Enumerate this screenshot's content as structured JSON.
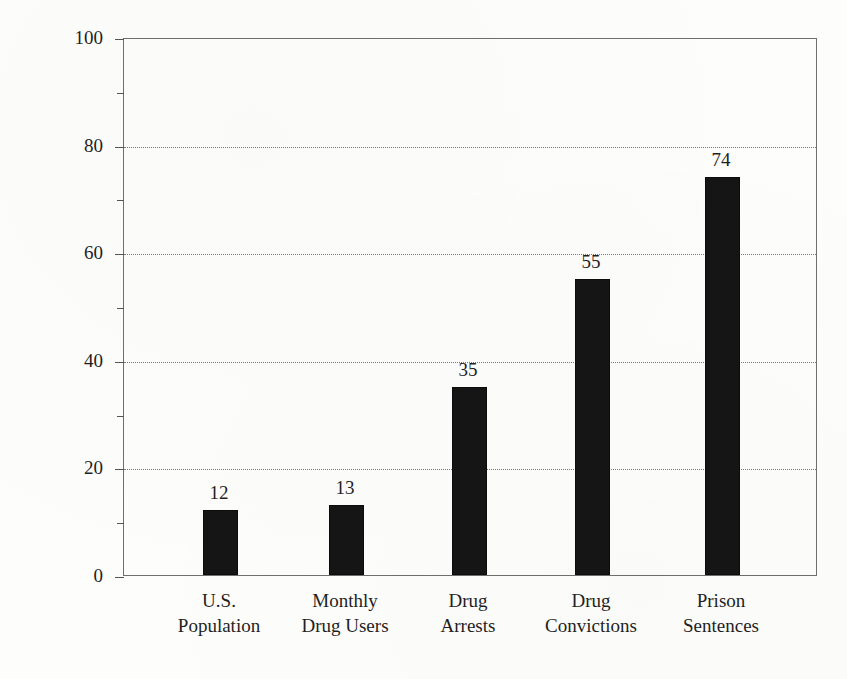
{
  "chart_data": {
    "type": "bar",
    "title": "",
    "subtitle": "",
    "xlabel": "",
    "ylabel": "African American Percentage",
    "categories": [
      "U.S. Population",
      "Monthly Drug Users",
      "Drug Arrests",
      "Drug Convictions",
      "Prison Sentences"
    ],
    "category_lines": [
      [
        "U.S.",
        "Population"
      ],
      [
        "Monthly",
        "Drug Users"
      ],
      [
        "Drug",
        "Arrests"
      ],
      [
        "Drug",
        "Convictions"
      ],
      [
        "Prison",
        "Sentences"
      ]
    ],
    "values": [
      12,
      13,
      35,
      55,
      74
    ],
    "value_labels": [
      "12",
      "13",
      "35",
      "55",
      "74"
    ],
    "ylim": [
      0,
      100
    ],
    "y_major_ticks": [
      0,
      20,
      40,
      60,
      80,
      100
    ],
    "y_major_tick_labels": [
      "0",
      "20",
      "40",
      "60",
      "80",
      "100"
    ],
    "y_minor_ticks": [
      10,
      30,
      50,
      70,
      90
    ],
    "gridlines_at": [
      20,
      40,
      60,
      80
    ],
    "grid": "horizontal-dotted",
    "legend": "none",
    "bar_color": "#151515",
    "axis_color": "#6f6f6f",
    "grid_color": "#7a7a7a",
    "text_color": "#1f1f1f",
    "background_color": "#fdfdfc"
  },
  "figure": {
    "plot_left_px": 123,
    "plot_top_px": 38,
    "plot_width_px": 694,
    "plot_height_px": 538,
    "bar_width_px": 35,
    "bar_centers_px": [
      219,
      345,
      468,
      591,
      721
    ]
  }
}
